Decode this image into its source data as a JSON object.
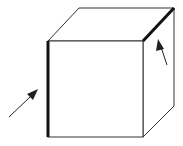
{
  "diagram": {
    "title": "Cube with highlighted edges",
    "colors": {
      "background": "#ffffff",
      "line": "#333333",
      "highlight": "#111111",
      "arrow": "#222222"
    },
    "cube": {
      "front_face": {
        "top_left": [
          48,
          41
        ],
        "top_right": [
          143,
          41
        ],
        "bottom_right": [
          143,
          137
        ],
        "bottom_left": [
          48,
          137
        ]
      },
      "back_vertices": {
        "top_left": [
          79,
          8
        ],
        "top_right": [
          174,
          8
        ],
        "bottom_right": [
          174,
          106
        ]
      },
      "highlighted_edges": [
        {
          "name": "front-left-vertical-edge",
          "from": [
            48,
            41
          ],
          "to": [
            48,
            137
          ]
        },
        {
          "name": "top-right-diagonal-edge",
          "from": [
            143,
            41
          ],
          "to": [
            174,
            8
          ]
        }
      ]
    },
    "arrows": [
      {
        "name": "left-arrow",
        "from": [
          9,
          117
        ],
        "to": [
          38,
          89
        ],
        "points_to": "front-left-vertical-edge"
      },
      {
        "name": "right-arrow",
        "from": [
          167,
          65
        ],
        "to": [
          159,
          39
        ],
        "points_to": "top-right-diagonal-edge"
      }
    ]
  }
}
